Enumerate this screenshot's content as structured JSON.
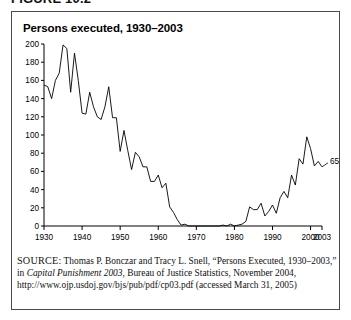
{
  "figure": {
    "label": "FIGURE 10.2"
  },
  "chart": {
    "title": "Persons executed, 1930–2003",
    "end_label": "65"
  },
  "source": {
    "kicker": "SOURCE:",
    "text_part1": " Thomas P. Bonczar and Tracy L. Snell, “Persons Executed, 1930–2003,” in ",
    "italic_title": "Capital Punishment 2003",
    "text_part2": ", Bureau of Justice Statistics, November 2004, http://www.ojp.usdoj.gov/bjs/pub/pdf/cp03.pdf (accessed March 31, 2005)"
  },
  "chart_data": {
    "type": "line",
    "title": "Persons executed, 1930–2003",
    "xlabel": "",
    "ylabel": "",
    "xlim": [
      1930,
      2003
    ],
    "ylim": [
      0,
      200
    ],
    "grid": false,
    "legend": null,
    "xticks": [
      1930,
      1940,
      1950,
      1960,
      1970,
      1980,
      1990,
      2000,
      2003
    ],
    "yticks": [
      0,
      20,
      40,
      60,
      80,
      100,
      120,
      140,
      160,
      180,
      200
    ],
    "annotations": [
      {
        "text": "65",
        "x": 2003,
        "y": 65
      }
    ],
    "x": [
      1930,
      1931,
      1932,
      1933,
      1934,
      1935,
      1936,
      1937,
      1938,
      1939,
      1940,
      1941,
      1942,
      1943,
      1944,
      1945,
      1946,
      1947,
      1948,
      1949,
      1950,
      1951,
      1952,
      1953,
      1954,
      1955,
      1956,
      1957,
      1958,
      1959,
      1960,
      1961,
      1962,
      1963,
      1964,
      1965,
      1966,
      1967,
      1968,
      1969,
      1970,
      1971,
      1972,
      1973,
      1974,
      1975,
      1976,
      1977,
      1978,
      1979,
      1980,
      1981,
      1982,
      1983,
      1984,
      1985,
      1986,
      1987,
      1988,
      1989,
      1990,
      1991,
      1992,
      1993,
      1994,
      1995,
      1996,
      1997,
      1998,
      1999,
      2000,
      2001,
      2002,
      2003
    ],
    "values": [
      155,
      153,
      140,
      160,
      168,
      199,
      195,
      147,
      190,
      160,
      124,
      123,
      147,
      131,
      120,
      117,
      131,
      153,
      119,
      119,
      82,
      105,
      83,
      62,
      81,
      76,
      65,
      65,
      49,
      49,
      56,
      42,
      47,
      21,
      15,
      7,
      1,
      2,
      0,
      0,
      0,
      0,
      0,
      0,
      0,
      0,
      0,
      1,
      0,
      2,
      0,
      1,
      2,
      5,
      21,
      18,
      18,
      25,
      11,
      16,
      23,
      14,
      31,
      38,
      31,
      56,
      45,
      74,
      68,
      98,
      85,
      66,
      71,
      65
    ],
    "series": [
      {
        "name": "Persons executed",
        "values": [
          155,
          153,
          140,
          160,
          168,
          199,
          195,
          147,
          190,
          160,
          124,
          123,
          147,
          131,
          120,
          117,
          131,
          153,
          119,
          119,
          82,
          105,
          83,
          62,
          81,
          76,
          65,
          65,
          49,
          49,
          56,
          42,
          47,
          21,
          15,
          7,
          1,
          2,
          0,
          0,
          0,
          0,
          0,
          0,
          0,
          0,
          0,
          1,
          0,
          2,
          0,
          1,
          2,
          5,
          21,
          18,
          18,
          25,
          11,
          16,
          23,
          14,
          31,
          38,
          31,
          56,
          45,
          74,
          68,
          98,
          85,
          66,
          71,
          65
        ]
      }
    ]
  }
}
